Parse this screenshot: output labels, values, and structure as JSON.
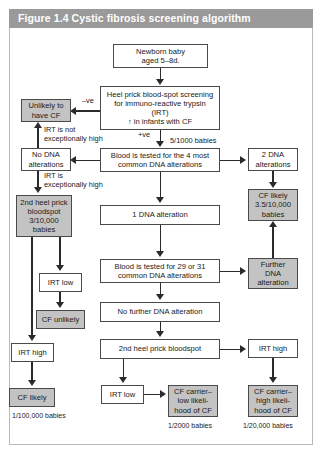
{
  "figure": {
    "header": "Figure 1.4  Cystic fibrosis screening algorithm",
    "label": "Figure 1.4",
    "title": "Cystic fibrosis screening algorithm"
  },
  "colors": {
    "header_background": "#9a9a9a",
    "header_text": "#ffffff",
    "shaded_box": "#c3c3c3",
    "plain_box": "#ffffff",
    "box_border": "#4a4a4a",
    "connector": "#2b2b2b",
    "frame_border": "#b9b9b9"
  },
  "nodes": {
    "newborn": "Newborn baby\naged 5–8d.",
    "heel_prick_irt": "Heel prick blood-spot screening\nfor immuno-reactive trypsin\n(IRT)\n↑ in infants with CF",
    "unlikely_have_cf": "Unlikely to\nhave CF",
    "no_dna_alterations": "No DNA\nalterations",
    "second_heel_prick_left": "2nd heel prick\nbloodspot\n3/10,000\nbabies",
    "irt_low_left": "IRT low",
    "cf_unlikely": "CF unlikely",
    "irt_high_left": "IRT high",
    "cf_likely_left": "CF likely",
    "blood_tested_4": "Blood is tested for the 4 most\ncommon DNA alterations",
    "two_dna_alterations": "2 DNA\nalterations",
    "cf_likely_right": "CF likely\n3.5/10,000\nbabies",
    "one_dna_alteration": "1 DNA alteration",
    "blood_tested_29_31": "Blood is tested for 29 or 31\ncommon DNA alterations",
    "further_dna_alteration": "Further\nDNA\nalteration",
    "no_further_dna_alteration": "No further DNA alteration",
    "second_heel_prick_center": "2nd heel prick bloodspot",
    "irt_high_right": "IRT high",
    "irt_low_center": "IRT low",
    "cf_carrier_low": "CF carrier–\nlow likeli-\nhood of CF",
    "cf_carrier_high": "CF carrier–\nhigh likeli-\nhood of CF"
  },
  "edge_labels": {
    "negative": "–ve",
    "positive": "+ve",
    "five_per_1000": "5/1000 babies",
    "irt_not_exceptionally_high": "IRT is not\nexceptionally high",
    "irt_is_exceptionally_high": "IRT is\nexceptionally high"
  },
  "footnotes": {
    "left": "1/100,000 babies",
    "center": "1/2000 babies",
    "right": "1/20,000 babies"
  }
}
